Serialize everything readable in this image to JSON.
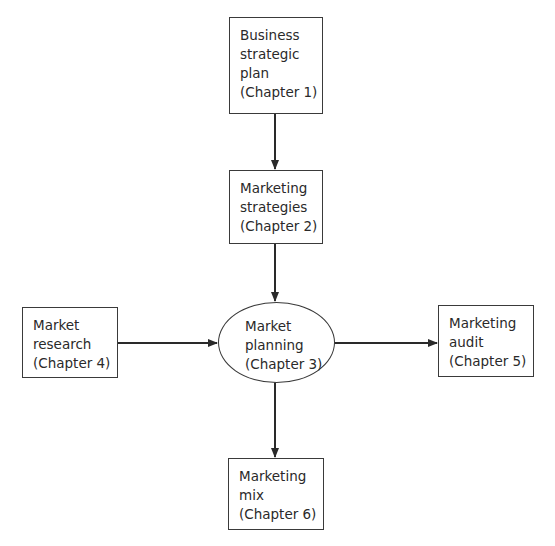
{
  "diagram": {
    "type": "flowchart",
    "colors": {
      "line": "#2a2a2a",
      "text": "#2a2a2a",
      "background": "#ffffff"
    },
    "nodes": {
      "business_strategic_plan": {
        "shape": "rectangle",
        "lines": [
          "Business",
          "strategic",
          "plan",
          "(Chapter 1)"
        ]
      },
      "marketing_strategies": {
        "shape": "rectangle",
        "lines": [
          "Marketing",
          "strategies",
          "(Chapter 2)"
        ]
      },
      "market_planning": {
        "shape": "ellipse",
        "lines": [
          "Market",
          "planning",
          "(Chapter 3)"
        ]
      },
      "market_research": {
        "shape": "rectangle",
        "lines": [
          "Market",
          "research",
          "(Chapter 4)"
        ]
      },
      "marketing_audit": {
        "shape": "rectangle",
        "lines": [
          "Marketing",
          "audit",
          "(Chapter 5)"
        ]
      },
      "marketing_mix": {
        "shape": "rectangle",
        "lines": [
          "Marketing",
          "mix",
          "(Chapter 6)"
        ]
      }
    },
    "edges": [
      {
        "from": "business_strategic_plan",
        "to": "marketing_strategies"
      },
      {
        "from": "marketing_strategies",
        "to": "market_planning"
      },
      {
        "from": "market_research",
        "to": "market_planning"
      },
      {
        "from": "market_planning",
        "to": "marketing_audit"
      },
      {
        "from": "market_planning",
        "to": "marketing_mix"
      }
    ]
  }
}
